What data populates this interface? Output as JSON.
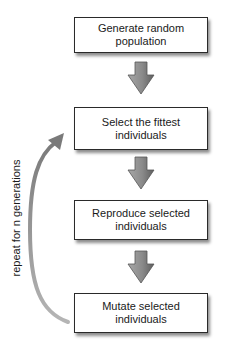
{
  "diagram": {
    "type": "flowchart",
    "title": "",
    "colors": {
      "box_border": "#2a2a2a",
      "box_fill": "#ffffff",
      "arrow_light": "#a8a8a8",
      "arrow_dark": "#6a6a6a",
      "loop_arrow": "#9a9a9a",
      "text": "#1a1a1a"
    },
    "steps": [
      {
        "label": "Generate random population"
      },
      {
        "label": "Select the fittest individuals"
      },
      {
        "label": "Reproduce selected individuals"
      },
      {
        "label": "Mutate selected individuals"
      }
    ],
    "loop": {
      "label": "repeat for n generations",
      "from_step": 4,
      "to_step": 2
    }
  }
}
